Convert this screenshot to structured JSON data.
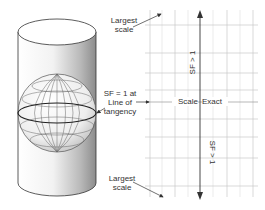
{
  "labels": {
    "largest_scale_top": [
      "Largest",
      "scale"
    ],
    "largest_scale_bottom": [
      "Largest",
      "scale"
    ],
    "tangency": [
      "SF = 1 at",
      "Line of",
      "tangency"
    ],
    "scale_exact_left": "Scale",
    "scale_exact_right": "Exact",
    "sf_upper": "SF > 1",
    "sf_lower": "SF > 1"
  },
  "colors": {
    "line": "#333333",
    "grid": "#c8c8c8",
    "cylinder_shade": "#9a9a9a",
    "globe_line": "#555555"
  },
  "grid": {
    "x": [
      150,
      175,
      200,
      227,
      253
    ],
    "minor_x": [
      162,
      188,
      213,
      240
    ],
    "rows": 9
  }
}
